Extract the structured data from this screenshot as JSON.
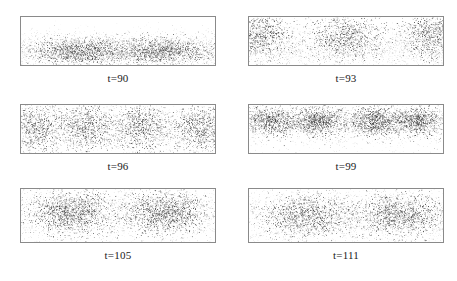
{
  "figure": {
    "background_color": "#ffffff",
    "border_color": "#8a8a8a",
    "particle_color": "#3a3a3a",
    "label_color": "#1a1a1a",
    "columns": 2,
    "rows": 3
  },
  "panels": [
    {
      "label": "t=90",
      "time": 90,
      "x": 20,
      "y": 16,
      "width": 196,
      "height": 50,
      "label_y": 72,
      "description": "horizontal dense band in lower half with two darker lobes",
      "n_points": 5200,
      "band": {
        "y_center": 0.7,
        "y_sigma": 0.2
      },
      "clusters": [
        {
          "cx": 0.3,
          "cy": 0.7,
          "sx": 0.13,
          "sy": 0.13,
          "weight": 0.26
        },
        {
          "cx": 0.72,
          "cy": 0.7,
          "sx": 0.13,
          "sy": 0.13,
          "weight": 0.26
        }
      ]
    },
    {
      "label": "t=93",
      "time": 93,
      "x": 248,
      "y": 16,
      "width": 196,
      "height": 50,
      "label_y": 72,
      "description": "wave-like arc, particles rise at edges and center, dips between",
      "n_points": 5200,
      "band": {
        "y_center": 0.68,
        "y_sigma": 0.22
      },
      "clusters": [
        {
          "cx": 0.04,
          "cy": 0.35,
          "sx": 0.09,
          "sy": 0.24,
          "weight": 0.2
        },
        {
          "cx": 0.5,
          "cy": 0.4,
          "sx": 0.1,
          "sy": 0.24,
          "weight": 0.2
        },
        {
          "cx": 0.96,
          "cy": 0.35,
          "sx": 0.09,
          "sy": 0.24,
          "weight": 0.2
        }
      ]
    },
    {
      "label": "t=96",
      "time": 96,
      "x": 20,
      "y": 104,
      "width": 196,
      "height": 50,
      "label_y": 160,
      "description": "four diffuse vertical clumps emerging across the box",
      "n_points": 5000,
      "band": {
        "y_center": 0.5,
        "y_sigma": 0.34
      },
      "clusters": [
        {
          "cx": 0.08,
          "cy": 0.46,
          "sx": 0.07,
          "sy": 0.26,
          "weight": 0.17
        },
        {
          "cx": 0.34,
          "cy": 0.46,
          "sx": 0.08,
          "sy": 0.26,
          "weight": 0.19
        },
        {
          "cx": 0.62,
          "cy": 0.46,
          "sx": 0.08,
          "sy": 0.26,
          "weight": 0.19
        },
        {
          "cx": 0.92,
          "cy": 0.46,
          "sx": 0.07,
          "sy": 0.26,
          "weight": 0.17
        }
      ]
    },
    {
      "label": "t=99",
      "time": 99,
      "x": 248,
      "y": 104,
      "width": 196,
      "height": 50,
      "label_y": 160,
      "description": "four compact dark clusters in upper half, sparse tail below",
      "n_points": 5000,
      "band": {
        "y_center": 0.46,
        "y_sigma": 0.3
      },
      "clusters": [
        {
          "cx": 0.11,
          "cy": 0.33,
          "sx": 0.07,
          "sy": 0.15,
          "weight": 0.2
        },
        {
          "cx": 0.36,
          "cy": 0.33,
          "sx": 0.07,
          "sy": 0.15,
          "weight": 0.21
        },
        {
          "cx": 0.64,
          "cy": 0.33,
          "sx": 0.07,
          "sy": 0.15,
          "weight": 0.21
        },
        {
          "cx": 0.87,
          "cy": 0.33,
          "sx": 0.07,
          "sy": 0.15,
          "weight": 0.2
        }
      ]
    },
    {
      "label": "t=105",
      "time": 105,
      "x": 20,
      "y": 188,
      "width": 196,
      "height": 55,
      "label_y": 249,
      "description": "two large merged clusters, left and right of centre",
      "n_points": 4800,
      "band": {
        "y_center": 0.48,
        "y_sigma": 0.36
      },
      "clusters": [
        {
          "cx": 0.26,
          "cy": 0.44,
          "sx": 0.11,
          "sy": 0.2,
          "weight": 0.33
        },
        {
          "cx": 0.74,
          "cy": 0.44,
          "sx": 0.11,
          "sy": 0.2,
          "weight": 0.33
        }
      ]
    },
    {
      "label": "t=111",
      "time": 111,
      "x": 248,
      "y": 188,
      "width": 196,
      "height": 55,
      "label_y": 249,
      "description": "two broad diffuse clusters, more spread than t=105",
      "n_points": 4800,
      "band": {
        "y_center": 0.5,
        "y_sigma": 0.38
      },
      "clusters": [
        {
          "cx": 0.3,
          "cy": 0.5,
          "sx": 0.13,
          "sy": 0.2,
          "weight": 0.3
        },
        {
          "cx": 0.78,
          "cy": 0.48,
          "sx": 0.12,
          "sy": 0.2,
          "weight": 0.3
        }
      ]
    }
  ],
  "chart_data": {
    "type": "scatter",
    "title": "",
    "xlabel": "",
    "ylabel": "",
    "grid": false,
    "legend": null,
    "subplot_labels": [
      "t=90",
      "t=93",
      "t=96",
      "t=99",
      "t=105",
      "t=111"
    ],
    "times": [
      90,
      93,
      96,
      99,
      105,
      111
    ],
    "cluster_counts": [
      2,
      3,
      4,
      4,
      2,
      2
    ],
    "xlim": [
      0,
      1
    ],
    "ylim": [
      0,
      1
    ],
    "series": [
      {
        "name": "t=90",
        "cluster_x": [
          0.3,
          0.72
        ],
        "cluster_y": [
          0.7,
          0.7
        ]
      },
      {
        "name": "t=93",
        "cluster_x": [
          0.04,
          0.5,
          0.96
        ],
        "cluster_y": [
          0.35,
          0.4,
          0.35
        ]
      },
      {
        "name": "t=96",
        "cluster_x": [
          0.08,
          0.34,
          0.62,
          0.92
        ],
        "cluster_y": [
          0.46,
          0.46,
          0.46,
          0.46
        ]
      },
      {
        "name": "t=99",
        "cluster_x": [
          0.11,
          0.36,
          0.64,
          0.87
        ],
        "cluster_y": [
          0.33,
          0.33,
          0.33,
          0.33
        ]
      },
      {
        "name": "t=105",
        "cluster_x": [
          0.26,
          0.74
        ],
        "cluster_y": [
          0.44,
          0.44
        ]
      },
      {
        "name": "t=111",
        "cluster_x": [
          0.3,
          0.78
        ],
        "cluster_y": [
          0.5,
          0.48
        ]
      }
    ]
  }
}
